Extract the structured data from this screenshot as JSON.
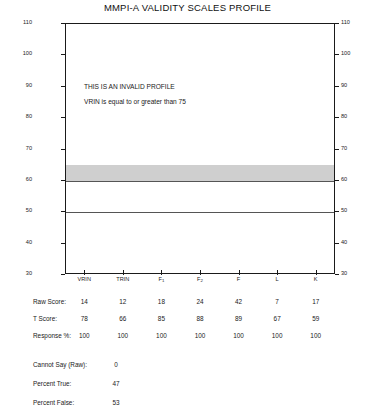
{
  "chart_data": {
    "type": "table",
    "title": "MMPI-A VALIDITY SCALES PROFILE",
    "xlabel": "",
    "ylabel": "",
    "ylim": [
      30,
      110
    ],
    "ytick_labels": [
      "110",
      "100",
      "90",
      "80",
      "70",
      "60",
      "50",
      "40",
      "30"
    ],
    "ytick_values": [
      110,
      100,
      90,
      80,
      70,
      60,
      50,
      40,
      30
    ],
    "grid": false,
    "legend": "none",
    "categories": [
      "VRIN",
      "TRIN",
      "F1",
      "F2",
      "F",
      "L",
      "K"
    ],
    "category_labels": [
      {
        "base": "VRIN",
        "sub": ""
      },
      {
        "base": "TRIN",
        "sub": ""
      },
      {
        "base": "F",
        "sub": "1"
      },
      {
        "base": "F",
        "sub": "2"
      },
      {
        "base": "F",
        "sub": ""
      },
      {
        "base": "L",
        "sub": ""
      },
      {
        "base": "K",
        "sub": ""
      }
    ],
    "series": [
      {
        "name": "Raw Score",
        "values": [
          14,
          12,
          18,
          24,
          42,
          7,
          17
        ]
      },
      {
        "name": "T Score",
        "values": [
          78,
          66,
          85,
          88,
          89,
          67,
          59
        ]
      },
      {
        "name": "Response %",
        "values": [
          100,
          100,
          100,
          100,
          100,
          100,
          100
        ]
      }
    ],
    "shaded_band": {
      "from": 60,
      "to": 65,
      "color": "#cfcfcf"
    },
    "reference_lines": [
      {
        "value": 60,
        "color": "#555555"
      },
      {
        "value": 50,
        "color": "#555555"
      }
    ],
    "annotations": [
      "THIS IS AN INVALID PROFILE",
      "VRIN is equal to or greater than 75"
    ]
  },
  "table": {
    "rows": [
      {
        "label": "Raw Score:",
        "values": [
          "14",
          "12",
          "18",
          "24",
          "42",
          "7",
          "17"
        ]
      },
      {
        "label": "T Score:",
        "values": [
          "78",
          "66",
          "85",
          "88",
          "89",
          "67",
          "59"
        ]
      },
      {
        "label": "Response %:",
        "values": [
          "100",
          "100",
          "100",
          "100",
          "100",
          "100",
          "100"
        ]
      }
    ]
  },
  "summary": {
    "rows": [
      {
        "label": "Cannot Say (Raw):",
        "value": "0"
      },
      {
        "label": "Percent True:",
        "value": "47"
      },
      {
        "label": "Percent False:",
        "value": "53"
      }
    ]
  },
  "colors": {
    "band": "#cfcfcf",
    "axis": "#1a1a1a",
    "reference_line": "#555555",
    "text": "#1a1a1a"
  }
}
